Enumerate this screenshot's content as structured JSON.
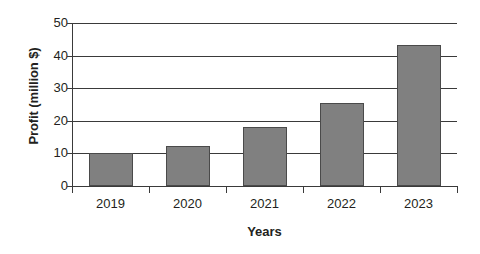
{
  "chart_data": {
    "type": "bar",
    "title": "",
    "xlabel": "Years",
    "ylabel": "Profit (million $)",
    "categories": [
      "2019",
      "2020",
      "2021",
      "2022",
      "2023"
    ],
    "values": [
      10,
      12.3,
      18.1,
      25.6,
      43.4
    ],
    "series": [
      {
        "name": "Profit",
        "values": [
          10,
          12.3,
          18.1,
          25.6,
          43.4
        ]
      }
    ],
    "ylim": [
      0,
      50
    ],
    "ytick_labels": [
      "0",
      "10",
      "20",
      "30",
      "40",
      "50"
    ],
    "ytick_values": [
      0,
      10,
      20,
      30,
      40,
      50
    ],
    "grid": "horizontal",
    "legend": "none",
    "bar_color": "#808080",
    "bar_border_color": "#4a4a4a",
    "axis_color": "#3a3a3a",
    "background_color": "#ffffff"
  }
}
